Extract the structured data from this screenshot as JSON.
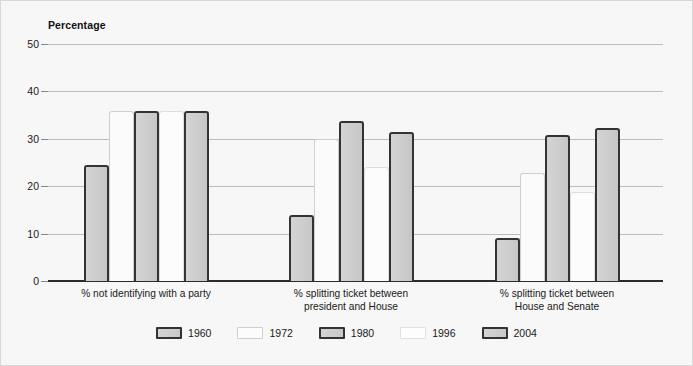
{
  "chart_data": {
    "type": "bar",
    "title": "",
    "ylabel": "Percentage",
    "xlabel": "",
    "ylim": [
      0,
      50
    ],
    "yticks": [
      0,
      10,
      20,
      30,
      40,
      50
    ],
    "grid": true,
    "legend_position": "bottom",
    "categories": [
      "% not identifying with a party",
      "% splitting ticket between\npresident and House",
      "% splitting ticket between\nHouse and Senate"
    ],
    "series": [
      {
        "name": "1960",
        "style": "shaded",
        "values": [
          24.5,
          14.0,
          9.0
        ]
      },
      {
        "name": "1972",
        "style": "light",
        "values": [
          35.8,
          30.0,
          22.7
        ]
      },
      {
        "name": "1980",
        "style": "shaded",
        "values": [
          35.8,
          33.7,
          30.8
        ]
      },
      {
        "name": "1996",
        "style": "plain",
        "values": [
          35.8,
          24.0,
          18.8
        ]
      },
      {
        "name": "2004",
        "style": "shaded",
        "values": [
          35.8,
          31.5,
          32.2
        ]
      }
    ]
  },
  "colors": {
    "background": "#f7f7f7",
    "frame_border": "#d8d8d8",
    "gridline": "#bdbdbd",
    "axis_line": "#2b2b2b",
    "bar_shaded_fill": "#cdcdcd",
    "bar_shaded_border": "#333333",
    "bar_light_fill": "#fbfbfb",
    "bar_light_border": "#cfcfcf",
    "text": "#1a1a1a"
  }
}
